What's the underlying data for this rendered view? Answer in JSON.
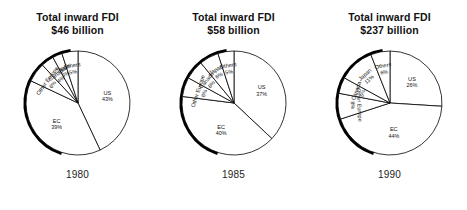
{
  "chart_data": [
    {
      "type": "pie",
      "title": "Total inward FDI\n$46 billion",
      "title_line1": "Total inward FDI",
      "title_line2": "$46 billion",
      "year": "1980",
      "total_label": "$46 billion",
      "categories": [
        "US",
        "EC",
        "Other Europe",
        "Canada",
        "Japan",
        "Others"
      ],
      "values": [
        43,
        39,
        6,
        4,
        3,
        5
      ],
      "labels": [
        "US",
        "EC",
        "Other Europe",
        "Canada",
        "Japan",
        "Others"
      ],
      "value_labels": [
        "43%",
        "39%",
        "6%",
        "4%",
        "3%",
        "5%"
      ],
      "units": "percent",
      "legend": "none",
      "start_angle_deg": 0
    },
    {
      "type": "pie",
      "title": "Total inward FDI\n$58 billion",
      "title_line1": "Total inward FDI",
      "title_line2": "$58 billion",
      "year": "1985",
      "total_label": "$58 billion",
      "categories": [
        "US",
        "EC",
        "Other Europe",
        "Canada",
        "Japan",
        "Others"
      ],
      "values": [
        37,
        40,
        6,
        6,
        6,
        5
      ],
      "labels": [
        "US",
        "EC",
        "Other Europe",
        "Canada",
        "Japan",
        "Others"
      ],
      "value_labels": [
        "37%",
        "40%",
        "6%",
        "6%",
        "6%",
        "5%"
      ],
      "units": "percent",
      "legend": "none",
      "start_angle_deg": 0
    },
    {
      "type": "pie",
      "title": "Total inward FDI\n$237 billion",
      "title_line1": "Total inward FDI",
      "title_line2": "$237 billion",
      "year": "1990",
      "total_label": "$237 billion",
      "categories": [
        "US",
        "EC",
        "Other Europe",
        "Canada",
        "Japan",
        "Others"
      ],
      "values": [
        26,
        44,
        8,
        5,
        11,
        6
      ],
      "labels": [
        "US",
        "EC",
        "Other Europe",
        "Canada",
        "Japan",
        "Others"
      ],
      "value_labels": [
        "26%",
        "44%",
        "8%",
        "5%",
        "11%",
        "6%"
      ],
      "units": "percent",
      "legend": "none",
      "start_angle_deg": 0
    }
  ],
  "panels": [
    {
      "title_line1": "Total inward FDI",
      "title_line2": "$46 billion",
      "year": "1980"
    },
    {
      "title_line1": "Total inward FDI",
      "title_line2": "$58 billion",
      "year": "1985"
    },
    {
      "title_line1": "Total inward FDI",
      "title_line2": "$237 billion",
      "year": "1990"
    }
  ],
  "style": {
    "slice_fill": "#ffffff",
    "slice_stroke": "#000000",
    "rim_shadow_color": "#000000",
    "text_color": "#111111"
  }
}
